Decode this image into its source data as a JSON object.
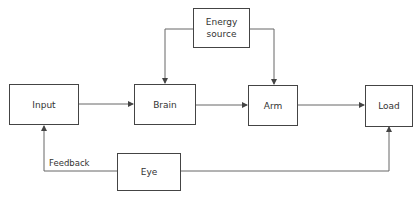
{
  "diagram": {
    "type": "block-diagram",
    "blocks": {
      "input": "Input",
      "brain": "Brain",
      "arm": "Arm",
      "load": "Load",
      "energy_line1": "Energy",
      "energy_line2": "source",
      "eye": "Eye"
    },
    "edge_labels": {
      "feedback": "Feedback"
    },
    "edges": [
      {
        "from": "Input",
        "to": "Brain"
      },
      {
        "from": "Brain",
        "to": "Arm"
      },
      {
        "from": "Arm",
        "to": "Load"
      },
      {
        "from": "Energy source",
        "to": "Brain"
      },
      {
        "from": "Energy source",
        "to": "Arm"
      },
      {
        "from": "Eye",
        "to": "Input",
        "label": "Feedback"
      },
      {
        "from": "Eye",
        "to": "Load"
      }
    ],
    "colors": {
      "line": "#555555",
      "box_border": "#444444",
      "text": "#333333"
    }
  }
}
